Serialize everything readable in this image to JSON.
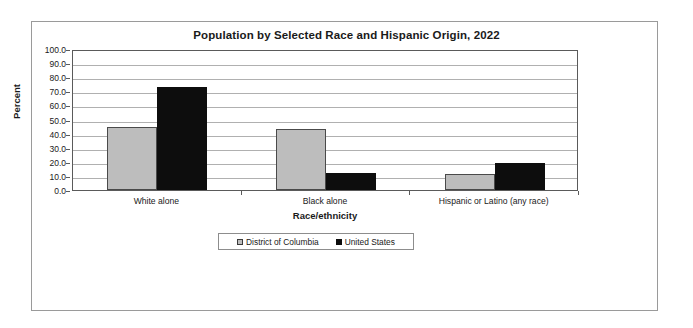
{
  "chart_data": {
    "type": "bar",
    "title": "Population by Selected Race and Hispanic Origin, 2022",
    "xlabel": "Race/ethnicity",
    "ylabel": "Percent",
    "ylim": [
      0,
      100
    ],
    "yticks": [
      "0.0",
      "10.0",
      "20.0",
      "30.0",
      "40.0",
      "50.0",
      "60.0",
      "70.0",
      "80.0",
      "90.0",
      "100.0"
    ],
    "grid": true,
    "legend_position": "bottom",
    "categories": [
      "White alone",
      "Black alone",
      "Hispanic or Latino (any race)"
    ],
    "series": [
      {
        "name": "District of Columbia",
        "color": "#bdbdbd",
        "values": [
          44.6,
          43.3,
          11.5
        ]
      },
      {
        "name": "United States",
        "color": "#0d0d0d",
        "values": [
          73.0,
          12.1,
          18.9
        ]
      }
    ]
  }
}
